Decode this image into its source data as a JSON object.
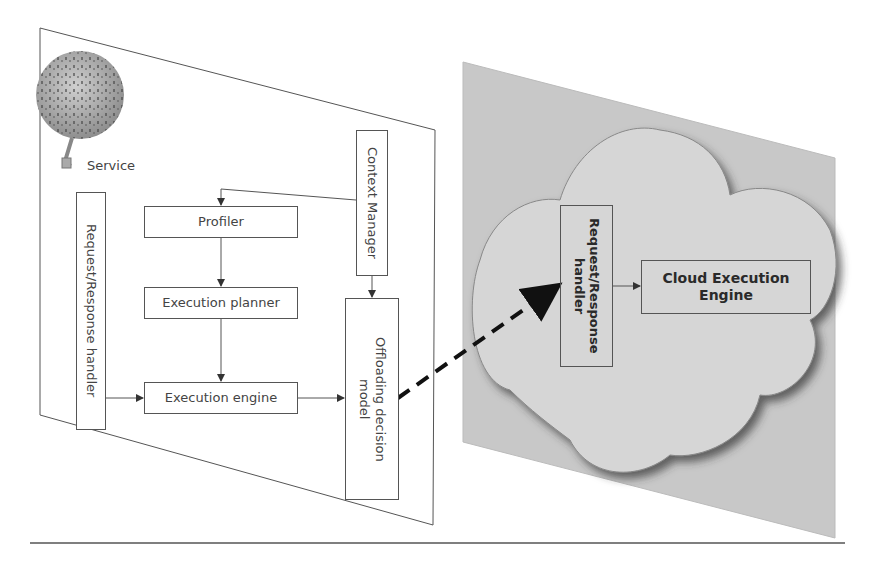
{
  "mobile_device": {
    "service_label": "Service",
    "components": {
      "request_response_handler": "Request/Response handler",
      "context_manager": "Context Manager",
      "profiler": "Profiler",
      "execution_planner": "Execution planner",
      "execution_engine": "Execution engine",
      "offloading_decision_model": "Offloading decision model"
    }
  },
  "cloud": {
    "components": {
      "request_response_handler": "Request/Response handler",
      "cloud_execution_engine": "Cloud Execution Engine"
    }
  },
  "connections": [
    {
      "from": "context_manager",
      "to": "profiler",
      "style": "solid"
    },
    {
      "from": "profiler",
      "to": "execution_planner",
      "style": "solid"
    },
    {
      "from": "execution_planner",
      "to": "execution_engine",
      "style": "solid"
    },
    {
      "from": "request_response_handler",
      "to": "execution_engine",
      "style": "solid"
    },
    {
      "from": "execution_engine",
      "to": "offloading_decision_model",
      "style": "solid"
    },
    {
      "from": "context_manager",
      "to": "offloading_decision_model",
      "style": "solid"
    },
    {
      "from": "offloading_decision_model",
      "to": "cloud.request_response_handler",
      "style": "dashed"
    },
    {
      "from": "cloud.request_response_handler",
      "to": "cloud_execution_engine",
      "style": "solid"
    }
  ],
  "colors": {
    "line": "#555555",
    "cloud_panel": "#c8c8c8",
    "cloud_fill": "#d6d6d6"
  }
}
